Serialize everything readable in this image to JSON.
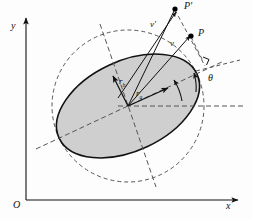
{
  "figure": {
    "background": "#fdfdfd"
  },
  "axes": {
    "origin_label": "O",
    "x_label": "x",
    "y_label": "y",
    "color": "#111111"
  },
  "shapes": {
    "ellipse": {
      "name": "shaded-ellipse",
      "fill": "#cfcfcf",
      "stroke": "#111111",
      "cx": 128,
      "cy": 106,
      "rx": 76,
      "ry": 45,
      "rotation_deg": -25
    },
    "circle": {
      "name": "dashed-circle",
      "stroke": "#555555",
      "cx": 128,
      "cy": 106,
      "r": 76,
      "dash": "4 3"
    }
  },
  "labels": {
    "point_p_prime": "P'",
    "point_p": "P",
    "velocity_prime": "v'",
    "velocity": "v",
    "radius_b": "r_b",
    "radius_b_main": "r",
    "radius_b_sub": "b",
    "radius_a_main": "r",
    "radius_a_sub": "a",
    "angle_theta": "θ"
  },
  "markers": {
    "right_angle": "right-angle-marker",
    "point_dot_color": "#000000"
  },
  "colors": {
    "solid_line": "#111111",
    "dashed_line": "#555555",
    "fill_gray": "#cfcfcf"
  }
}
